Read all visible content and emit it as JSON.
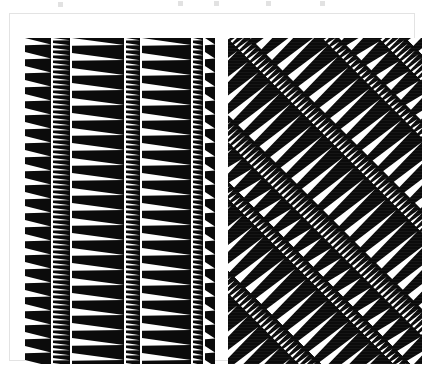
{
  "figure": {
    "background_color": "#ffffff",
    "ink_color": "#0b0b0b",
    "frame_color": "#e3e3e3",
    "frame": {
      "x": 9,
      "y": 13,
      "width": 406,
      "height": 348
    },
    "top_artifact_marks": [
      {
        "x": 58,
        "y": 2
      },
      {
        "x": 178,
        "y": 1
      },
      {
        "x": 214,
        "y": 1
      },
      {
        "x": 266,
        "y": 1
      },
      {
        "x": 320,
        "y": 1
      }
    ],
    "panels": [
      {
        "name": "left-panel",
        "label": "Vertical zigzag bands",
        "x": 15,
        "y": 24,
        "width": 190,
        "height": 326,
        "rotation_deg": 0,
        "bands": [
          {
            "name": "band-1",
            "x": 0,
            "width": 26,
            "pitch": 14,
            "tooth_ratio": 0.52,
            "direction": "right"
          },
          {
            "name": "band-2",
            "x": 28,
            "width": 17,
            "pitch": 5,
            "tooth_ratio": 0.55,
            "direction": "right"
          },
          {
            "name": "band-3",
            "x": 47,
            "width": 52,
            "pitch": 15,
            "tooth_ratio": 0.5,
            "direction": "right"
          },
          {
            "name": "band-4",
            "x": 101,
            "width": 14,
            "pitch": 5,
            "tooth_ratio": 0.55,
            "direction": "right"
          },
          {
            "name": "band-5",
            "x": 117,
            "width": 49,
            "pitch": 15,
            "tooth_ratio": 0.5,
            "direction": "right"
          },
          {
            "name": "band-6",
            "x": 168,
            "width": 10,
            "pitch": 5,
            "tooth_ratio": 0.55,
            "direction": "right"
          },
          {
            "name": "band-7",
            "x": 180,
            "width": 10,
            "pitch": 14,
            "tooth_ratio": 0.52,
            "direction": "right"
          }
        ]
      },
      {
        "name": "right-panel",
        "label": "Diagonal zigzag bands (45 degrees)",
        "x": 218,
        "y": 24,
        "width": 194,
        "height": 326,
        "rotation_deg": -45,
        "bands": [
          {
            "name": "band-1",
            "x": 0,
            "width": 26,
            "pitch": 14,
            "tooth_ratio": 0.52,
            "direction": "right"
          },
          {
            "name": "band-2",
            "x": 28,
            "width": 17,
            "pitch": 5,
            "tooth_ratio": 0.55,
            "direction": "right"
          },
          {
            "name": "band-3",
            "x": 47,
            "width": 52,
            "pitch": 15,
            "tooth_ratio": 0.5,
            "direction": "right"
          },
          {
            "name": "band-4",
            "x": 101,
            "width": 14,
            "pitch": 5,
            "tooth_ratio": 0.55,
            "direction": "right"
          },
          {
            "name": "band-5",
            "x": 117,
            "width": 49,
            "pitch": 15,
            "tooth_ratio": 0.5,
            "direction": "right"
          },
          {
            "name": "band-6",
            "x": 168,
            "width": 10,
            "pitch": 5,
            "tooth_ratio": 0.55,
            "direction": "right"
          },
          {
            "name": "band-7",
            "x": 180,
            "width": 26,
            "pitch": 14,
            "tooth_ratio": 0.52,
            "direction": "right"
          },
          {
            "name": "band-8",
            "x": 208,
            "width": 17,
            "pitch": 5,
            "tooth_ratio": 0.55,
            "direction": "right"
          },
          {
            "name": "band-9",
            "x": 227,
            "width": 52,
            "pitch": 15,
            "tooth_ratio": 0.5,
            "direction": "right"
          },
          {
            "name": "band-10",
            "x": 281,
            "width": 14,
            "pitch": 5,
            "tooth_ratio": 0.55,
            "direction": "right"
          },
          {
            "name": "band-11",
            "x": 297,
            "width": 49,
            "pitch": 15,
            "tooth_ratio": 0.5,
            "direction": "right"
          },
          {
            "name": "band-12",
            "x": 348,
            "width": 10,
            "pitch": 5,
            "tooth_ratio": 0.55,
            "direction": "right"
          },
          {
            "name": "band-13",
            "x": 360,
            "width": 26,
            "pitch": 14,
            "tooth_ratio": 0.52,
            "direction": "right"
          },
          {
            "name": "band-14",
            "x": 388,
            "width": 17,
            "pitch": 5,
            "tooth_ratio": 0.55,
            "direction": "right"
          },
          {
            "name": "band-15",
            "x": 407,
            "width": 52,
            "pitch": 15,
            "tooth_ratio": 0.5,
            "direction": "right"
          }
        ]
      }
    ]
  }
}
